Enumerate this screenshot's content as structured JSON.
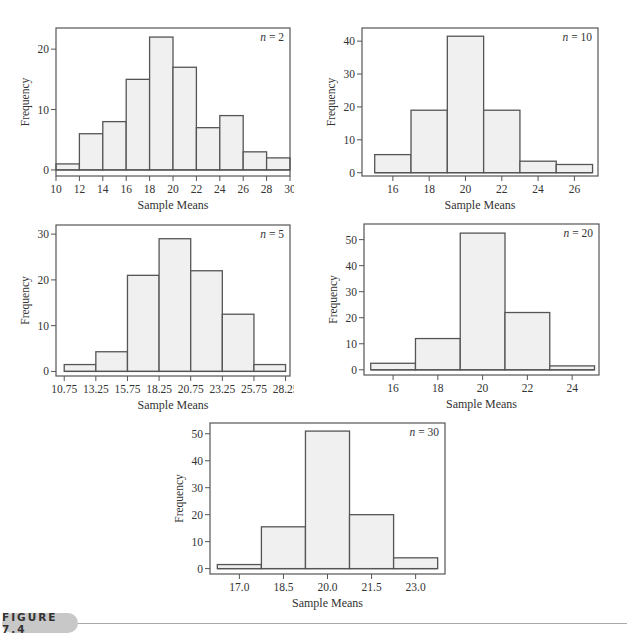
{
  "figure": {
    "label": "FIGURE 7.4"
  },
  "chart_data": [
    {
      "type": "bar",
      "title": "n = 2",
      "annotation": "n = 2",
      "xlabel": "Sample Means",
      "ylabel": "Frequency",
      "bin_edges": [
        10,
        12,
        14,
        16,
        18,
        20,
        22,
        24,
        26,
        28,
        30
      ],
      "categories": [
        "10-12",
        "12-14",
        "14-16",
        "16-18",
        "18-20",
        "20-22",
        "22-24",
        "24-26",
        "26-28",
        "28-30"
      ],
      "values": [
        1,
        6,
        8,
        15,
        22,
        17,
        7,
        9,
        3,
        2
      ],
      "xticks": [
        10,
        12,
        14,
        16,
        18,
        20,
        22,
        24,
        26,
        28,
        30
      ],
      "xtick_labels": [
        "10",
        "12",
        "14",
        "16",
        "18",
        "20",
        "22",
        "24",
        "26",
        "28",
        "30"
      ],
      "yticks": [
        0,
        10,
        20
      ],
      "xlim": [
        10,
        30
      ],
      "ylim": [
        -1,
        23.5
      ],
      "grid": false
    },
    {
      "type": "bar",
      "title": "n = 10",
      "annotation": "n = 10",
      "xlabel": "Sample Means",
      "ylabel": "Frequency",
      "bin_edges": [
        15,
        17,
        19,
        21,
        23,
        25,
        27
      ],
      "categories": [
        "15-17",
        "17-19",
        "19-21",
        "21-23",
        "23-25",
        "25-27"
      ],
      "values": [
        5.5,
        19,
        41.5,
        19,
        3.5,
        2.5
      ],
      "xticks": [
        16,
        18,
        20,
        22,
        24,
        26
      ],
      "xtick_labels": [
        "16",
        "18",
        "20",
        "22",
        "24",
        "26"
      ],
      "yticks": [
        0,
        10,
        20,
        30,
        40
      ],
      "xlim": [
        14.3,
        27.3
      ],
      "ylim": [
        -1,
        44
      ],
      "grid": false
    },
    {
      "type": "bar",
      "title": "n = 5",
      "annotation": "n = 5",
      "xlabel": "Sample Means",
      "ylabel": "Frequency",
      "bin_edges": [
        10.75,
        13.25,
        15.75,
        18.25,
        20.75,
        23.25,
        25.75,
        28.25
      ],
      "categories": [
        "10.75-13.25",
        "13.25-15.75",
        "15.75-18.25",
        "18.25-20.75",
        "20.75-23.25",
        "23.25-25.75",
        "25.75-28.25"
      ],
      "values": [
        1.5,
        4.3,
        21,
        29,
        22,
        12.5,
        1.5
      ],
      "xticks": [
        10.75,
        13.25,
        15.75,
        18.25,
        20.75,
        23.25,
        25.75,
        28.25
      ],
      "xtick_labels": [
        "10.75",
        "13.25",
        "15.75",
        "18.25",
        "20.75",
        "23.25",
        "25.75",
        "28.25"
      ],
      "yticks": [
        0,
        10,
        20,
        30
      ],
      "xlim": [
        10.1,
        28.6
      ],
      "ylim": [
        -1,
        32
      ],
      "grid": false
    },
    {
      "type": "bar",
      "title": "n = 20",
      "annotation": "n = 20",
      "xlabel": "Sample Means",
      "ylabel": "Frequency",
      "bin_edges": [
        15,
        17,
        19,
        21,
        23,
        25
      ],
      "categories": [
        "15-17",
        "17-19",
        "19-21",
        "21-23",
        "23-25"
      ],
      "values": [
        2.5,
        12,
        52.5,
        22,
        1.5
      ],
      "xticks": [
        16,
        18,
        20,
        22,
        24
      ],
      "xtick_labels": [
        "16",
        "18",
        "20",
        "22",
        "24"
      ],
      "yticks": [
        0,
        10,
        20,
        30,
        40,
        50
      ],
      "xlim": [
        14.7,
        25.2
      ],
      "ylim": [
        -2,
        56
      ],
      "grid": false
    },
    {
      "type": "bar",
      "title": "n = 30",
      "annotation": "n = 30",
      "xlabel": "Sample Means",
      "ylabel": "Frequency",
      "bin_edges": [
        16.25,
        17.75,
        19.25,
        20.75,
        22.25,
        23.75
      ],
      "categories": [
        "16.25-17.75",
        "17.75-19.25",
        "19.25-20.75",
        "20.75-22.25",
        "22.25-23.75"
      ],
      "values": [
        1.5,
        15.5,
        51,
        20,
        4
      ],
      "xticks": [
        17.0,
        18.5,
        20.0,
        21.5,
        23.0
      ],
      "xtick_labels": [
        "17.0",
        "18.5",
        "20.0",
        "21.5",
        "23.0"
      ],
      "yticks": [
        0,
        10,
        20,
        30,
        40,
        50
      ],
      "xlim": [
        16.0,
        24.0
      ],
      "ylim": [
        -2,
        54
      ],
      "grid": false
    }
  ],
  "layout": [
    {
      "left": 56,
      "top": 28,
      "width": 234,
      "height": 148
    },
    {
      "left": 362,
      "top": 28,
      "width": 236,
      "height": 148
    },
    {
      "left": 56,
      "top": 225,
      "width": 234,
      "height": 151
    },
    {
      "left": 364,
      "top": 224,
      "width": 235,
      "height": 151
    },
    {
      "left": 210,
      "top": 423,
      "width": 235,
      "height": 151
    }
  ],
  "colors": {
    "bar_fill": "#f0f0f0",
    "bar_stroke": "#555555",
    "frame": "#555555",
    "text": "#333333"
  }
}
